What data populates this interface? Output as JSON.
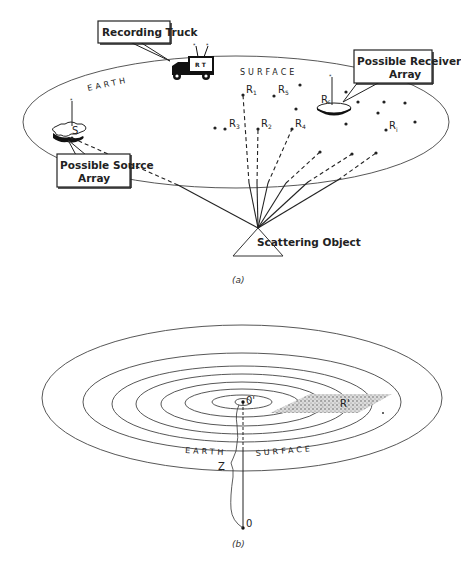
{
  "figure_a": {
    "caption": "(a)",
    "callouts": {
      "recording_truck": "Recording Truck",
      "receiver_array_line1": "Possible Receiver",
      "receiver_array_line2": "Array",
      "source_array_line1": "Possible Source",
      "source_array_line2": "Array"
    },
    "truck_sign": "R T",
    "surface_label_left": "EARTH",
    "surface_label_right": "SURFACE",
    "source_label": "S",
    "receivers": [
      {
        "label": "R",
        "sub": "1"
      },
      {
        "label": "R",
        "sub": "2"
      },
      {
        "label": "R",
        "sub": "3"
      },
      {
        "label": "R",
        "sub": "4"
      },
      {
        "label": "R",
        "sub": "5"
      },
      {
        "label": "R",
        "sub": "6"
      },
      {
        "label": "R",
        "sub": "i"
      }
    ],
    "object_label": "Scattering Object"
  },
  "figure_b": {
    "caption": "(b)",
    "surface_label_left": "EARTH",
    "surface_label_right": "SURFACE",
    "origin_surface_label": "0'",
    "origin_depth_label": "0",
    "depth_label": "Z",
    "receiver_label": "R'"
  }
}
